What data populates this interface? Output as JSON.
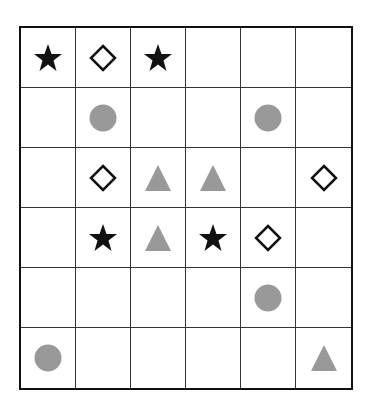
{
  "puzzle": {
    "rows": 6,
    "cols": 6,
    "colors": {
      "star": "#111111",
      "diamond": "#111111",
      "circle": "#999999",
      "triangle": "#999999"
    },
    "cells": [
      [
        "star",
        "diamond",
        "star",
        "",
        "",
        ""
      ],
      [
        "",
        "circle",
        "",
        "",
        "circle",
        ""
      ],
      [
        "",
        "diamond",
        "triangle",
        "triangle",
        "",
        "diamond"
      ],
      [
        "",
        "star",
        "triangle",
        "star",
        "diamond",
        ""
      ],
      [
        "",
        "",
        "",
        "",
        "circle",
        ""
      ],
      [
        "circle",
        "",
        "",
        "",
        "",
        "triangle"
      ]
    ]
  }
}
